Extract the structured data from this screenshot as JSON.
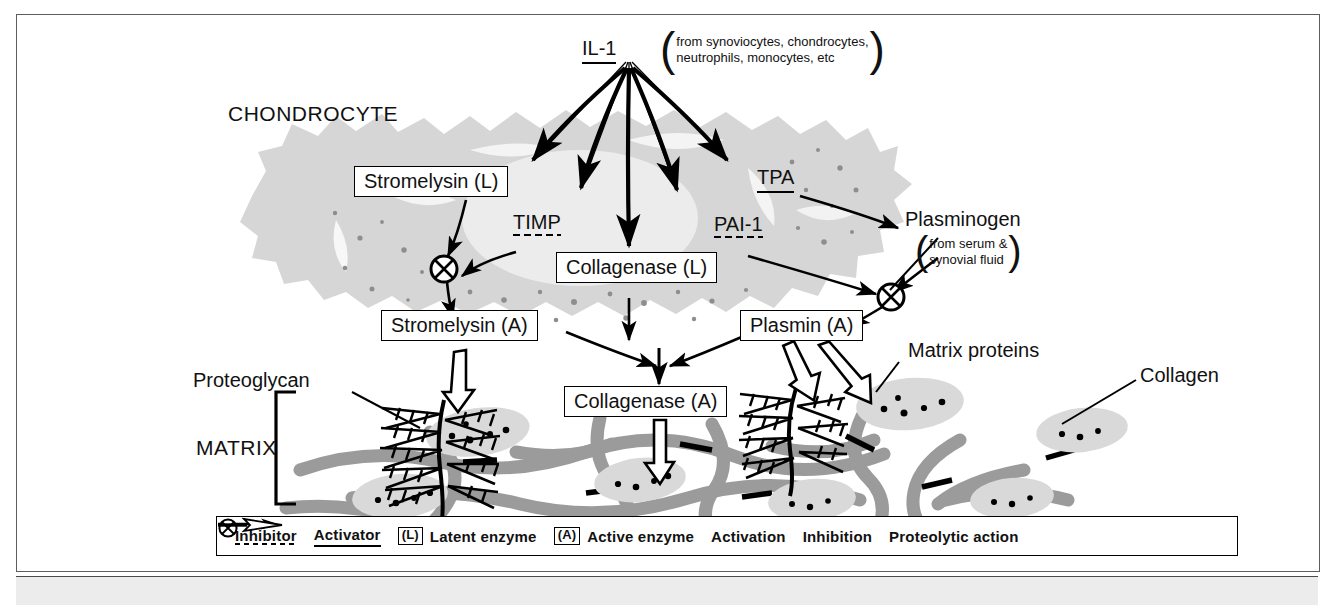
{
  "diagram": {
    "title_nodes": {
      "chondrocyte": "CHONDROCYTE",
      "matrix": "MATRIX"
    },
    "il1": {
      "label": "IL-1",
      "source_line1": "from synoviocytes, chondrocytes,",
      "source_line2": "neutrophils, monocytes, etc"
    },
    "plasminogen": {
      "label": "Plasminogen",
      "source_line1": "from serum &",
      "source_line2": "synovial fluid"
    },
    "regulators": [
      {
        "label": "TIMP",
        "kind": "inhibitor"
      },
      {
        "label": "TPA",
        "kind": "activator"
      },
      {
        "label": "PAI-1",
        "kind": "inhibitor"
      }
    ],
    "enzymes": [
      {
        "label": "Stromelysin (L)",
        "state": "latent"
      },
      {
        "label": "Collagenase (L)",
        "state": "latent"
      },
      {
        "label": "Stromelysin (A)",
        "state": "active"
      },
      {
        "label": "Plasmin (A)",
        "state": "active"
      },
      {
        "label": "Collagenase (A)",
        "state": "active"
      }
    ],
    "matrix_labels": {
      "proteoglycan": "Proteoglycan",
      "matrix_proteins": "Matrix proteins",
      "collagen": "Collagen"
    }
  },
  "legend": {
    "inhibitor": "Inhibitor",
    "activator": "Activator",
    "latent_tag": "(L)",
    "latent_text": "Latent enzyme",
    "active_tag": "(A)",
    "active_text": "Active enzyme",
    "activation": "Activation",
    "inhibition": "Inhibition",
    "proteolytic": "Proteolytic action"
  },
  "colors": {
    "cell_fill": "#d6d6d6",
    "nucleus_fill": "#ececec",
    "collagen_fibril": "#9b9b9b",
    "matrix_protein": "#d9d9d9",
    "line": "#000000",
    "frame": "#5d5d5d"
  }
}
